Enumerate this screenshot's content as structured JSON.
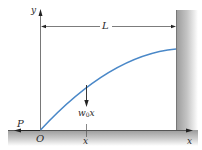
{
  "diagram": {
    "title": "",
    "labels": {
      "y_axis": "y",
      "x_axis": "x",
      "length": "L",
      "origin": "O",
      "force": "P",
      "load_main": "w",
      "load_sub": "0",
      "load_var": "x",
      "x_tick": "x"
    },
    "colors": {
      "curve": "#4a88c8",
      "line": "#333333",
      "wall": "#a8a8a8",
      "ground": "#a8a8a8"
    }
  }
}
